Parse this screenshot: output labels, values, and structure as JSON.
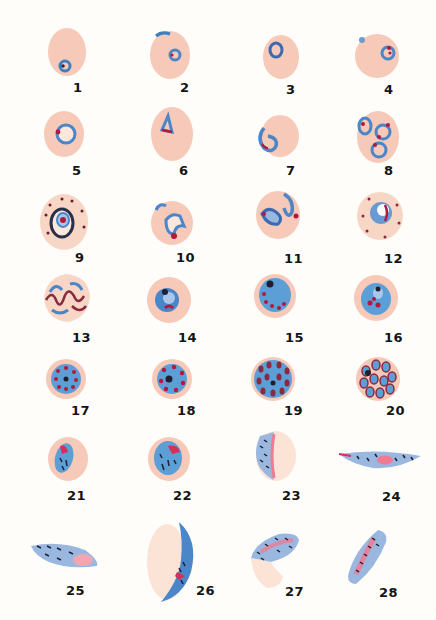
{
  "plate": {
    "background": "#fefdfa",
    "colors": {
      "rbc": "#f6c9b8",
      "rbc_edge": "#eeb7a3",
      "cytoplasm": "#5b9fd6",
      "cytoplasm_pale": "#9ab7e0",
      "chromatin": "#b3183d",
      "pigment": "#2a2a3a",
      "gametocyte_pink": "#ef7b92"
    },
    "figures": [
      {
        "n": "1",
        "label": "1",
        "stage": "ring",
        "x": 58,
        "y": 40,
        "lx": 63,
        "ly": 92
      },
      {
        "n": "2",
        "label": "2",
        "stage": "ring",
        "x": 163,
        "y": 40,
        "lx": 180,
        "ly": 92
      },
      {
        "n": "3",
        "label": "3",
        "stage": "ring",
        "x": 264,
        "y": 40,
        "lx": 284,
        "ly": 92
      },
      {
        "n": "4",
        "label": "4",
        "stage": "ring",
        "x": 355,
        "y": 40,
        "lx": 382,
        "ly": 92
      },
      {
        "n": "5",
        "label": "5",
        "stage": "ring",
        "x": 58,
        "y": 114,
        "lx": 71,
        "ly": 166
      },
      {
        "n": "6",
        "label": "6",
        "stage": "ring",
        "x": 163,
        "y": 114,
        "lx": 178,
        "ly": 166
      },
      {
        "n": "7",
        "label": "7",
        "stage": "ring",
        "x": 264,
        "y": 114,
        "lx": 284,
        "ly": 166
      },
      {
        "n": "8",
        "label": "8",
        "stage": "ring",
        "x": 355,
        "y": 114,
        "lx": 384,
        "ly": 166
      },
      {
        "n": "9",
        "label": "9",
        "stage": "trophozoite",
        "x": 58,
        "y": 196,
        "lx": 74,
        "ly": 254
      },
      {
        "n": "10",
        "label": "10",
        "stage": "trophozoite",
        "x": 163,
        "y": 196,
        "lx": 178,
        "ly": 254
      },
      {
        "n": "11",
        "label": "11",
        "stage": "trophozoite",
        "x": 264,
        "y": 196,
        "lx": 284,
        "ly": 254
      },
      {
        "n": "12",
        "label": "12",
        "stage": "trophozoite",
        "x": 355,
        "y": 196,
        "lx": 384,
        "ly": 254
      },
      {
        "n": "13",
        "label": "13",
        "stage": "trophozoite",
        "x": 58,
        "y": 275,
        "lx": 72,
        "ly": 334
      },
      {
        "n": "14",
        "label": "14",
        "stage": "trophozoite",
        "x": 163,
        "y": 275,
        "lx": 176,
        "ly": 334
      },
      {
        "n": "15",
        "label": "15",
        "stage": "schizont",
        "x": 264,
        "y": 275,
        "lx": 284,
        "ly": 334
      },
      {
        "n": "16",
        "label": "16",
        "stage": "schizont",
        "x": 355,
        "y": 275,
        "lx": 384,
        "ly": 334
      },
      {
        "n": "17",
        "label": "17",
        "stage": "schizont",
        "x": 58,
        "y": 354,
        "lx": 72,
        "ly": 405
      },
      {
        "n": "18",
        "label": "18",
        "stage": "schizont",
        "x": 163,
        "y": 354,
        "lx": 176,
        "ly": 405
      },
      {
        "n": "19",
        "label": "19",
        "stage": "schizont",
        "x": 264,
        "y": 354,
        "lx": 284,
        "ly": 405
      },
      {
        "n": "20",
        "label": "20",
        "stage": "schizont",
        "x": 355,
        "y": 354,
        "lx": 384,
        "ly": 405
      },
      {
        "n": "21",
        "label": "21",
        "stage": "gametocyte",
        "x": 58,
        "y": 438,
        "lx": 66,
        "ly": 487
      },
      {
        "n": "22",
        "label": "22",
        "stage": "gametocyte",
        "x": 163,
        "y": 438,
        "lx": 174,
        "ly": 487
      },
      {
        "n": "23",
        "label": "23",
        "stage": "gametocyte",
        "x": 264,
        "y": 430,
        "lx": 282,
        "ly": 488
      },
      {
        "n": "24",
        "label": "24",
        "stage": "gametocyte",
        "x": 340,
        "y": 445,
        "lx": 381,
        "ly": 489
      },
      {
        "n": "25",
        "label": "25",
        "stage": "gametocyte",
        "x": 30,
        "y": 538,
        "lx": 64,
        "ly": 576
      },
      {
        "n": "26",
        "label": "26",
        "stage": "gametocyte",
        "x": 147,
        "y": 520,
        "lx": 196,
        "ly": 578
      },
      {
        "n": "27",
        "label": "27",
        "stage": "gametocyte",
        "x": 240,
        "y": 528,
        "lx": 284,
        "ly": 577
      },
      {
        "n": "28",
        "label": "28",
        "stage": "gametocyte",
        "x": 348,
        "y": 528,
        "lx": 379,
        "ly": 582
      }
    ]
  }
}
